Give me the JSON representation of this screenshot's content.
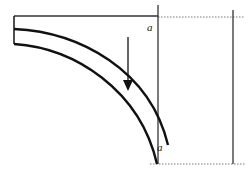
{
  "diagram": {
    "labels": {
      "top_a": "a",
      "bottom_a": "a"
    },
    "colors": {
      "stroke": "#111111",
      "dotted": "#555555",
      "background": "#ffffff"
    }
  }
}
